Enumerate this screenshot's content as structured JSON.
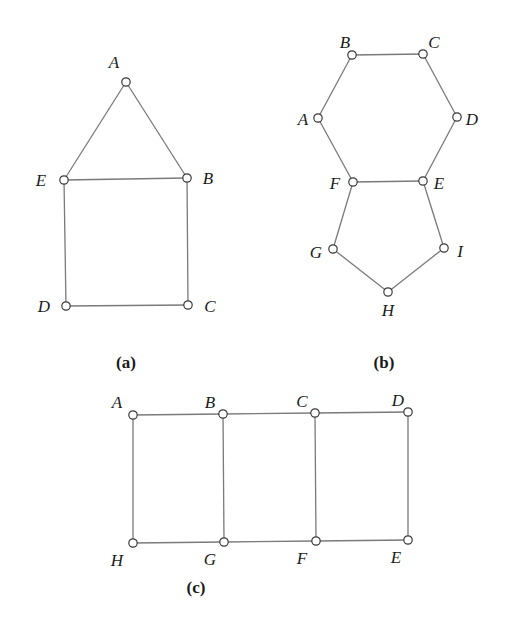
{
  "graphs": {
    "a": {
      "caption": "(a)",
      "caption_pos": [
        126,
        368
      ],
      "vertices": [
        {
          "id": "A",
          "x": 126,
          "y": 82,
          "lx": 114,
          "ly": 68
        },
        {
          "id": "B",
          "x": 187,
          "y": 178,
          "lx": 208,
          "ly": 184
        },
        {
          "id": "C",
          "x": 188,
          "y": 305,
          "lx": 210,
          "ly": 312
        },
        {
          "id": "D",
          "x": 66,
          "y": 306,
          "lx": 44,
          "ly": 312
        },
        {
          "id": "E",
          "x": 64,
          "y": 180,
          "lx": 41,
          "ly": 186
        }
      ],
      "edges": [
        [
          "A",
          "E"
        ],
        [
          "A",
          "B"
        ],
        [
          "E",
          "B"
        ],
        [
          "E",
          "D"
        ],
        [
          "B",
          "C"
        ],
        [
          "D",
          "C"
        ]
      ]
    },
    "b": {
      "caption": "(b)",
      "caption_pos": [
        384,
        368
      ],
      "vertices": [
        {
          "id": "A",
          "x": 318,
          "y": 118,
          "lx": 303,
          "ly": 125
        },
        {
          "id": "B",
          "x": 352,
          "y": 55,
          "lx": 345,
          "ly": 48
        },
        {
          "id": "C",
          "x": 423,
          "y": 54,
          "lx": 434,
          "ly": 48
        },
        {
          "id": "D",
          "x": 457,
          "y": 117,
          "lx": 472,
          "ly": 125
        },
        {
          "id": "E",
          "x": 423,
          "y": 181,
          "lx": 439,
          "ly": 189
        },
        {
          "id": "F",
          "x": 353,
          "y": 182,
          "lx": 335,
          "ly": 189
        },
        {
          "id": "G",
          "x": 333,
          "y": 249,
          "lx": 316,
          "ly": 258
        },
        {
          "id": "H",
          "x": 388,
          "y": 292,
          "lx": 388,
          "ly": 316
        },
        {
          "id": "I",
          "x": 444,
          "y": 248,
          "lx": 460,
          "ly": 257
        }
      ],
      "edges": [
        [
          "A",
          "B"
        ],
        [
          "B",
          "C"
        ],
        [
          "C",
          "D"
        ],
        [
          "D",
          "E"
        ],
        [
          "E",
          "F"
        ],
        [
          "F",
          "A"
        ],
        [
          "F",
          "G"
        ],
        [
          "G",
          "H"
        ],
        [
          "H",
          "I"
        ],
        [
          "I",
          "E"
        ]
      ]
    },
    "c": {
      "caption": "(c)",
      "caption_pos": [
        196,
        593
      ],
      "vertices": [
        {
          "id": "A",
          "x": 133,
          "y": 415,
          "lx": 117,
          "ly": 408
        },
        {
          "id": "B",
          "x": 223,
          "y": 414,
          "lx": 210,
          "ly": 408
        },
        {
          "id": "C",
          "x": 315,
          "y": 413,
          "lx": 302,
          "ly": 407
        },
        {
          "id": "D",
          "x": 408,
          "y": 412,
          "lx": 398,
          "ly": 406
        },
        {
          "id": "E",
          "x": 408,
          "y": 540,
          "lx": 396,
          "ly": 563
        },
        {
          "id": "F",
          "x": 316,
          "y": 541,
          "lx": 302,
          "ly": 564
        },
        {
          "id": "G",
          "x": 224,
          "y": 542,
          "lx": 210,
          "ly": 565
        },
        {
          "id": "H",
          "x": 133,
          "y": 543,
          "lx": 117,
          "ly": 566
        }
      ],
      "edges": [
        [
          "A",
          "B"
        ],
        [
          "B",
          "C"
        ],
        [
          "C",
          "D"
        ],
        [
          "D",
          "E"
        ],
        [
          "E",
          "F"
        ],
        [
          "F",
          "G"
        ],
        [
          "G",
          "H"
        ],
        [
          "H",
          "A"
        ],
        [
          "B",
          "G"
        ],
        [
          "C",
          "F"
        ]
      ]
    }
  }
}
